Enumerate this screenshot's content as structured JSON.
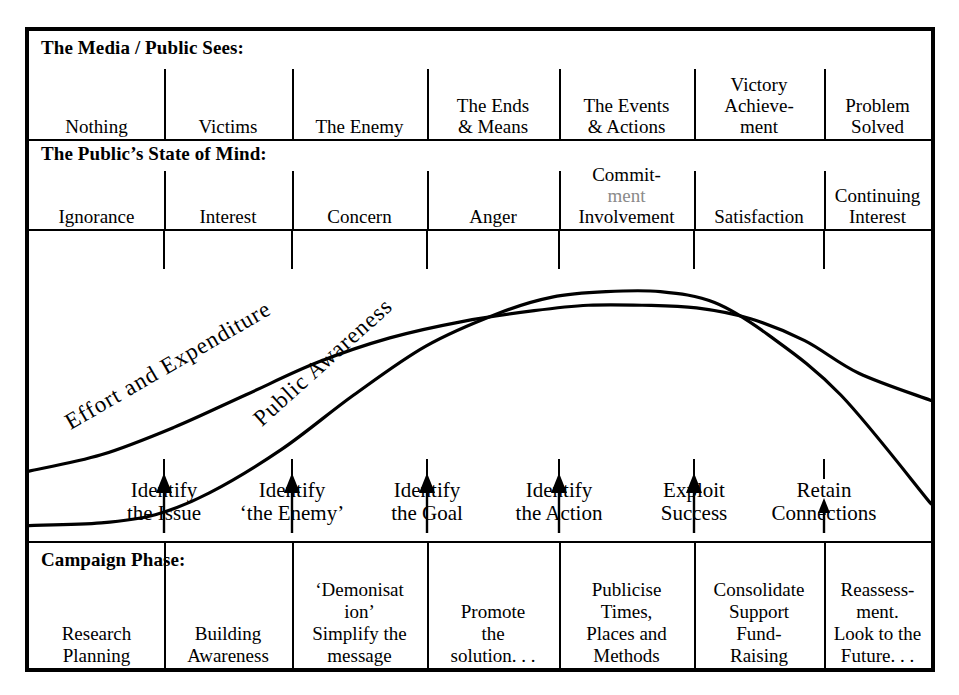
{
  "columns": 7,
  "media_row": {
    "title": "The Media / Public Sees:",
    "cells": [
      {
        "lines": [
          "Nothing"
        ]
      },
      {
        "lines": [
          "Victims"
        ]
      },
      {
        "lines": [
          "The Enemy"
        ]
      },
      {
        "lines": [
          "The Ends",
          "& Means"
        ]
      },
      {
        "lines": [
          "The Events",
          "& Actions"
        ]
      },
      {
        "lines": [
          "Victory",
          "Achieve-",
          "ment"
        ]
      },
      {
        "lines": [
          "Problem",
          "Solved"
        ]
      }
    ]
  },
  "mind_row": {
    "title": "The Public’s State of Mind:",
    "cells": [
      {
        "lines": [
          "Ignorance"
        ]
      },
      {
        "lines": [
          "Interest"
        ]
      },
      {
        "lines": [
          "Concern"
        ]
      },
      {
        "lines": [
          "Anger"
        ]
      },
      {
        "lines": [
          "Commit-",
          "ment",
          "Involvement"
        ],
        "faded_line": 1
      },
      {
        "lines": [
          "Satisfaction"
        ]
      },
      {
        "lines": [
          "Continuing",
          "Interest"
        ]
      }
    ]
  },
  "milestones": [
    {
      "lines": [
        "Identify",
        "the Issue"
      ]
    },
    {
      "lines": [
        "Identify",
        "‘the Enemy’"
      ]
    },
    {
      "lines": [
        "Identify",
        "the Goal"
      ]
    },
    {
      "lines": [
        "Identify",
        "the Action"
      ]
    },
    {
      "lines": [
        "Exploit",
        "Success"
      ]
    },
    {
      "lines": [
        "Retain",
        "Connections"
      ]
    }
  ],
  "phase_row": {
    "title": "Campaign Phase:",
    "cells": [
      {
        "lines": [
          "Research",
          "Planning"
        ]
      },
      {
        "lines": [
          "Building",
          "Awareness"
        ]
      },
      {
        "lines": [
          "‘Demonisat",
          "ion’",
          "Simplify the",
          "message"
        ]
      },
      {
        "lines": [
          "Promote",
          "the",
          "solution. . ."
        ]
      },
      {
        "lines": [
          "Publicise",
          "Times,",
          "Places and",
          "Methods"
        ]
      },
      {
        "lines": [
          "Consolidate",
          "Support",
          "Fund-",
          "Raising"
        ]
      },
      {
        "lines": [
          "Reassess-",
          "ment.",
          "Look to the",
          "Future. . ."
        ]
      }
    ]
  },
  "chart_data": {
    "type": "line",
    "title": "",
    "xlabel": "",
    "ylabel": "",
    "grid": false,
    "legend": "inline-curve-labels",
    "x_ticks": [
      "Identify the Issue",
      "Identify ‘the Enemy’",
      "Identify the Goal",
      "Identify the Action",
      "Exploit Success",
      "Retain Connections"
    ],
    "xlim": [
      0,
      100
    ],
    "ylim": [
      0,
      100
    ],
    "series": [
      {
        "name": "Effort and Expenditure",
        "x": [
          0,
          8,
          16,
          24,
          32,
          40,
          48,
          56,
          62,
          68,
          74,
          80,
          86,
          92,
          100
        ],
        "y": [
          22,
          28,
          38,
          50,
          62,
          71,
          77,
          81,
          83,
          83,
          82,
          78,
          70,
          58,
          48
        ],
        "label_angle_deg": -27
      },
      {
        "name": "Public Awareness",
        "x": [
          0,
          8,
          14,
          20,
          28,
          36,
          44,
          52,
          58,
          64,
          70,
          76,
          82,
          90,
          100
        ],
        "y": [
          2,
          3,
          6,
          14,
          30,
          50,
          68,
          80,
          86,
          88,
          88,
          84,
          72,
          50,
          10
        ],
        "label_angle_deg": -40
      }
    ],
    "annotations": [
      {
        "text": "Effort and Expenditure",
        "curve": "Effort and Expenditure"
      },
      {
        "text": "Public Awareness",
        "curve": "Public Awareness"
      }
    ]
  },
  "colors": {
    "ink": "#000000",
    "paper": "#ffffff",
    "faded_ink": "#8a8a8a"
  }
}
